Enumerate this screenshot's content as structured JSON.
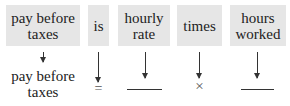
{
  "boxes": [
    {
      "label": "pay before taxes"
    },
    {
      "label": "is"
    },
    {
      "label": "hourly rate"
    },
    {
      "label": "times"
    },
    {
      "label": "hours worked"
    }
  ],
  "translation": {
    "term1": "pay before taxes",
    "equals": "=",
    "times": "×"
  },
  "colors": {
    "box_fill": "#e6e6e6",
    "text": "#222222"
  }
}
